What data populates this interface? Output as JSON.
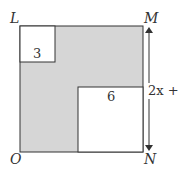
{
  "diagram": {
    "vertices": {
      "top_left": "L",
      "top_right": "M",
      "bottom_left": "O",
      "bottom_right": "N"
    },
    "small_square_label": "3",
    "large_square_label": "6",
    "side_label": "2x + 1",
    "colors": {
      "shaded": "#d6d6d6",
      "stroke": "#333333",
      "unshaded": "#ffffff"
    }
  }
}
